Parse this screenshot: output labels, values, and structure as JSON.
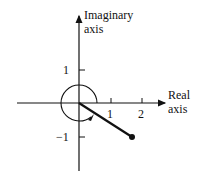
{
  "diagram": {
    "y_axis_label_line1": "Imaginary",
    "y_axis_label_line2": "axis",
    "x_axis_label_line1": "Real",
    "x_axis_label_line2": "axis",
    "x_ticks": [
      "1",
      "2"
    ],
    "y_ticks": [
      "1",
      "−1"
    ],
    "vector": {
      "real": 1.7,
      "imag": -1
    },
    "angle_arc": "clockwise circle around origin with arrowhead"
  }
}
